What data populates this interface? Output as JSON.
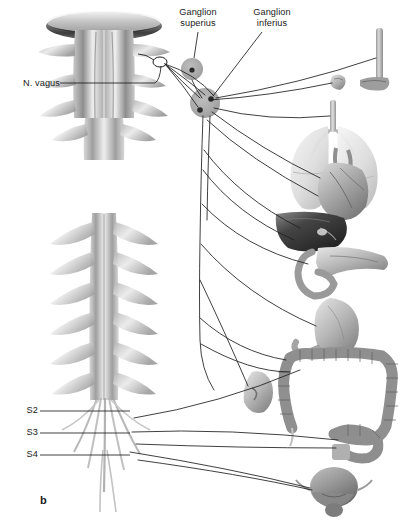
{
  "figure": {
    "panel_letter": "b",
    "background_color": "#ffffff",
    "text_color": "#1a1a1a",
    "line_color": "#1d1d1d",
    "ganglion_fill": "#a9a9a9",
    "ganglion_cell_color": "#2b2b2b"
  },
  "labels": {
    "ganglion_superius": "Ganglion\nsuperius",
    "ganglion_inferius": "Ganglion\ninferius",
    "n_vagus": "N. vagus",
    "s2": "S2",
    "s3": "S3",
    "s4": "S4"
  },
  "structures": {
    "brainstem": "brainstem-medulla-oblongata",
    "cerebellum": "cerebellum",
    "spinal_cord": "spinal-cord",
    "spinal_roots": "spinal-nerve-roots",
    "cauda_equina": "cauda-equina",
    "ganglion_superius": "ganglion-superius",
    "ganglion_inferius": "ganglion-inferius"
  },
  "organs": [
    {
      "id": "esophagus",
      "name": "Esophagus",
      "innervation": "vagus"
    },
    {
      "id": "larynx",
      "name": "Larynx",
      "innervation": "vagus"
    },
    {
      "id": "lungs",
      "name": "Lungs and trachea",
      "innervation": "vagus"
    },
    {
      "id": "heart",
      "name": "Heart",
      "innervation": "vagus"
    },
    {
      "id": "liver",
      "name": "Liver",
      "innervation": "vagus"
    },
    {
      "id": "pancreas",
      "name": "Pancreas and duodenum",
      "innervation": "vagus"
    },
    {
      "id": "stomach",
      "name": "Stomach",
      "innervation": "vagus"
    },
    {
      "id": "kidney",
      "name": "Kidney",
      "innervation": "vagus"
    },
    {
      "id": "large-intestine",
      "name": "Large intestine (colon)",
      "innervation": "vagus"
    },
    {
      "id": "rectum",
      "name": "Rectum and sigmoid colon",
      "innervation": "sacral"
    },
    {
      "id": "bladder",
      "name": "Urinary bladder and prostate",
      "innervation": "sacral"
    }
  ]
}
